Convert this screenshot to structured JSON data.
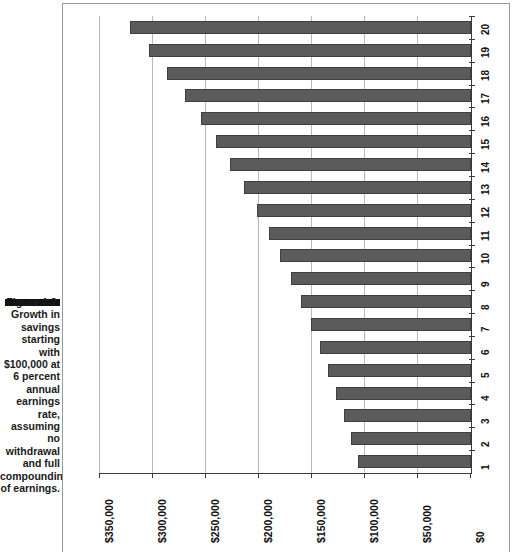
{
  "caption": {
    "lines": [
      "Figure 4-2:",
      "Growth in",
      "savings",
      "starting",
      "with",
      "$100,000 at",
      "6 percent",
      "annual",
      "earnings",
      "rate,",
      "assuming",
      "no",
      "withdrawal",
      "and full",
      "compounding",
      "of earnings."
    ]
  },
  "colors": {
    "bar_fill": "#5b5b5b",
    "bar_stroke": "#3f3f3f",
    "gridline": "#b9b9b9",
    "axis": "#3a3a3a",
    "frame": "#9a9a9a",
    "background": "#ffffff"
  },
  "chart_data": {
    "type": "bar",
    "orientation": "horizontal",
    "title": "",
    "subtitle": "",
    "xlabel": "",
    "ylabel": "",
    "x_axis_reversed": true,
    "grid": true,
    "legend": "none",
    "xlim": [
      0,
      350000
    ],
    "xticks": [
      350000,
      300000,
      250000,
      200000,
      150000,
      100000,
      50000,
      0
    ],
    "xtick_labels": [
      "$350,000",
      "$300,000",
      "$250,000",
      "$200,000",
      "$150,000",
      "$100,000",
      "$50,000",
      "$0"
    ],
    "categories": [
      "1",
      "2",
      "3",
      "4",
      "5",
      "6",
      "7",
      "8",
      "9",
      "10",
      "11",
      "12",
      "13",
      "14",
      "15",
      "16",
      "17",
      "18",
      "19",
      "20"
    ],
    "category_axis_position": "right",
    "values": [
      106000,
      112360,
      119102,
      126248,
      133823,
      141852,
      150363,
      159385,
      168948,
      179085,
      189830,
      201220,
      213293,
      226090,
      239656,
      254035,
      269277,
      285434,
      302560,
      320714
    ],
    "value_label_prefix": "$"
  }
}
